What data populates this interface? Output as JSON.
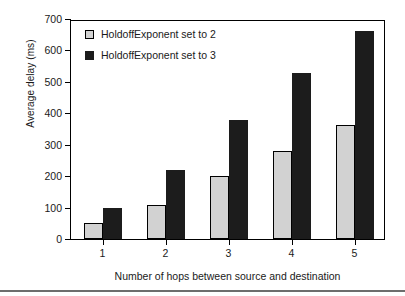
{
  "chart_data": {
    "type": "bar",
    "title": "",
    "subtitle": "",
    "xlabel": "Number of hops between source and destination",
    "ylabel": "Average delay (ms)",
    "categories": [
      "1",
      "2",
      "3",
      "4",
      "5"
    ],
    "series": [
      {
        "name": "HoldoffExponent set to 2",
        "color": "#d2d2d2",
        "edge_color": "#000000",
        "values": [
          52,
          108,
          200,
          280,
          362
        ]
      },
      {
        "name": "HoldoffExponent set to 3",
        "color": "#1c1c1c",
        "edge_color": "#1c1c1c",
        "values": [
          99,
          219,
          380,
          528,
          661
        ]
      }
    ],
    "ylim": [
      0,
      700
    ],
    "yticks": [
      0,
      100,
      200,
      300,
      400,
      500,
      600,
      700
    ],
    "ytick_labels": [
      "0",
      "100",
      "200",
      "300",
      "400",
      "500",
      "600",
      "700"
    ],
    "xtick_labels": [
      "1",
      "2",
      "3",
      "4",
      "5"
    ],
    "grid": false,
    "legend_position": "top-left-inside",
    "legend_entries": [
      "HoldoffExponent set to 2",
      "HoldoffExponent set to 3"
    ],
    "annotations": []
  },
  "figure": {
    "background_color": "#ffffff",
    "frame_color": "#000000",
    "text_color": "#1a1a1a",
    "rule_color": "#6d6d6d"
  }
}
